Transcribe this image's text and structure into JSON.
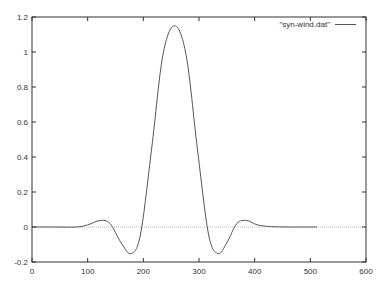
{
  "chart_data": {
    "type": "line",
    "title": "",
    "xlabel": "",
    "ylabel": "",
    "xlim": [
      0,
      600
    ],
    "ylim": [
      -0.2,
      1.2
    ],
    "grid": false,
    "legend_position": "top-right",
    "x_ticks": [
      0,
      100,
      200,
      300,
      400,
      500,
      600
    ],
    "x_tick_labels": [
      "0",
      "100",
      "200",
      "300",
      "400",
      "500",
      "600"
    ],
    "y_ticks": [
      -0.2,
      0,
      0.2,
      0.4,
      0.6,
      0.8,
      1,
      1.2
    ],
    "y_tick_labels": [
      "-0.2",
      "0",
      "0.2",
      "0.4",
      "0.6",
      "0.8",
      "1",
      "1.2"
    ],
    "zero_line": true,
    "series": [
      {
        "name": "\"syn-wind.dat\"",
        "color": "#555555",
        "x": [
          0,
          40,
          80,
          100,
          122,
          140,
          160,
          178,
          195,
          215,
          235,
          256,
          277,
          297,
          317,
          334,
          350,
          368,
          386,
          405,
          430,
          460,
          490,
          512
        ],
        "y": [
          0,
          0,
          0,
          0.012,
          0.037,
          0.02,
          -0.09,
          -0.152,
          -0.04,
          0.45,
          0.98,
          1.15,
          0.98,
          0.45,
          -0.04,
          -0.152,
          -0.09,
          0.02,
          0.037,
          0.012,
          0.002,
          0,
          0,
          0
        ]
      }
    ]
  },
  "legend": {
    "label": "\"syn-wind.dat\""
  }
}
